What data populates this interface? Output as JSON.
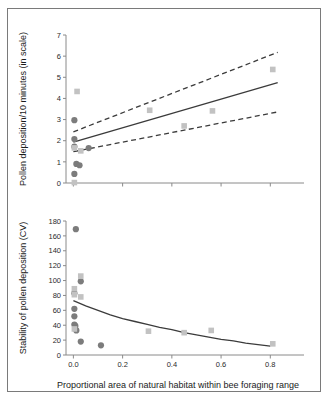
{
  "figure": {
    "frame_color": "#7a7a7a",
    "background": "#ffffff"
  },
  "chart_data": [
    {
      "type": "scatter",
      "id": "pollen-deposition",
      "panel": "top",
      "title": "",
      "xlabel": "",
      "ylabel": "Pollen deposition/10 minutes (in scale)",
      "xlim": [
        -0.03,
        0.88
      ],
      "ylim": [
        0,
        7
      ],
      "yticks": [
        0,
        1,
        2,
        3,
        4,
        5,
        6,
        7
      ],
      "ytick_labels": [
        "0",
        "1",
        "2",
        "3",
        "4",
        "5",
        "6",
        "7"
      ],
      "xticks": [
        0.0,
        0.2,
        0.4,
        0.6,
        0.8
      ],
      "xtick_labels": [
        "",
        "",
        "",
        "",
        ""
      ],
      "grid": false,
      "legend": "none",
      "series": [
        {
          "name": "circles",
          "marker": "circle",
          "color": "#7c7c7c",
          "points": [
            [
              0.004,
              2.97
            ],
            [
              0.004,
              2.08
            ],
            [
              0.004,
              1.72
            ],
            [
              0.004,
              0.43
            ],
            [
              0.012,
              0.9
            ],
            [
              0.025,
              0.84
            ],
            [
              0.062,
              1.65
            ]
          ]
        },
        {
          "name": "squares",
          "marker": "square",
          "color": "#c2c2c2",
          "points": [
            [
              0.015,
              4.33
            ],
            [
              0.004,
              1.66
            ],
            [
              0.004,
              0.02
            ],
            [
              0.03,
              1.52
            ],
            [
              0.31,
              3.44
            ],
            [
              0.45,
              2.7
            ],
            [
              0.565,
              3.41
            ],
            [
              0.81,
              5.37
            ]
          ]
        }
      ],
      "fit_line": {
        "style": "solid",
        "color": "#3b3b3b",
        "points": [
          [
            0.0,
            1.93
          ],
          [
            0.83,
            4.75
          ]
        ]
      },
      "confidence_bands": [
        {
          "style": "dashed",
          "color": "#3b3b3b",
          "points": [
            [
              0.0,
              2.42
            ],
            [
              0.83,
              6.18
            ]
          ]
        },
        {
          "style": "dashed",
          "color": "#3b3b3b",
          "points": [
            [
              0.0,
              1.48
            ],
            [
              0.83,
              3.36
            ]
          ]
        }
      ]
    },
    {
      "type": "scatter",
      "id": "stability-cv",
      "panel": "bottom",
      "title": "",
      "xlabel": "Proportional area of natural habitat within bee foraging range",
      "ylabel": "Stability of pollen deposition (CV)",
      "xlim": [
        -0.03,
        0.88
      ],
      "ylim": [
        0,
        180
      ],
      "yticks": [
        0,
        20,
        40,
        60,
        80,
        100,
        120,
        140,
        160,
        180
      ],
      "ytick_labels": [
        "0",
        "20",
        "40",
        "60",
        "80",
        "100",
        "120",
        "140",
        "160",
        "180"
      ],
      "xticks": [
        0.0,
        0.2,
        0.4,
        0.6,
        0.8
      ],
      "xtick_labels": [
        "0.0",
        "0.2",
        "0.4",
        "0.6",
        "0.8"
      ],
      "grid": false,
      "legend": "none",
      "series": [
        {
          "name": "circles",
          "marker": "circle",
          "color": "#7c7c7c",
          "points": [
            [
              0.01,
              169
            ],
            [
              0.03,
              99
            ],
            [
              0.004,
              83
            ],
            [
              0.004,
              62
            ],
            [
              0.004,
              52
            ],
            [
              0.004,
              41
            ],
            [
              0.008,
              39
            ],
            [
              0.012,
              33
            ],
            [
              0.03,
              18
            ],
            [
              0.112,
              13
            ]
          ]
        },
        {
          "name": "squares",
          "marker": "square",
          "color": "#c2c2c2",
          "points": [
            [
              0.03,
              106
            ],
            [
              0.004,
              89
            ],
            [
              0.004,
              81
            ],
            [
              0.03,
              78
            ],
            [
              0.004,
              35
            ],
            [
              0.305,
              32
            ],
            [
              0.45,
              30
            ],
            [
              0.56,
              33
            ],
            [
              0.81,
              15
            ]
          ]
        }
      ],
      "fit_line": {
        "style": "solid",
        "color": "#3b3b3b",
        "points": [
          [
            0.0,
            73
          ],
          [
            0.05,
            66
          ],
          [
            0.1,
            60
          ],
          [
            0.15,
            54
          ],
          [
            0.2,
            49
          ],
          [
            0.25,
            45
          ],
          [
            0.3,
            41
          ],
          [
            0.35,
            37
          ],
          [
            0.4,
            34
          ],
          [
            0.45,
            30
          ],
          [
            0.5,
            27
          ],
          [
            0.55,
            24
          ],
          [
            0.6,
            21
          ],
          [
            0.65,
            19
          ],
          [
            0.7,
            16
          ],
          [
            0.75,
            14
          ],
          [
            0.8,
            12
          ]
        ]
      },
      "confidence_bands": []
    }
  ]
}
